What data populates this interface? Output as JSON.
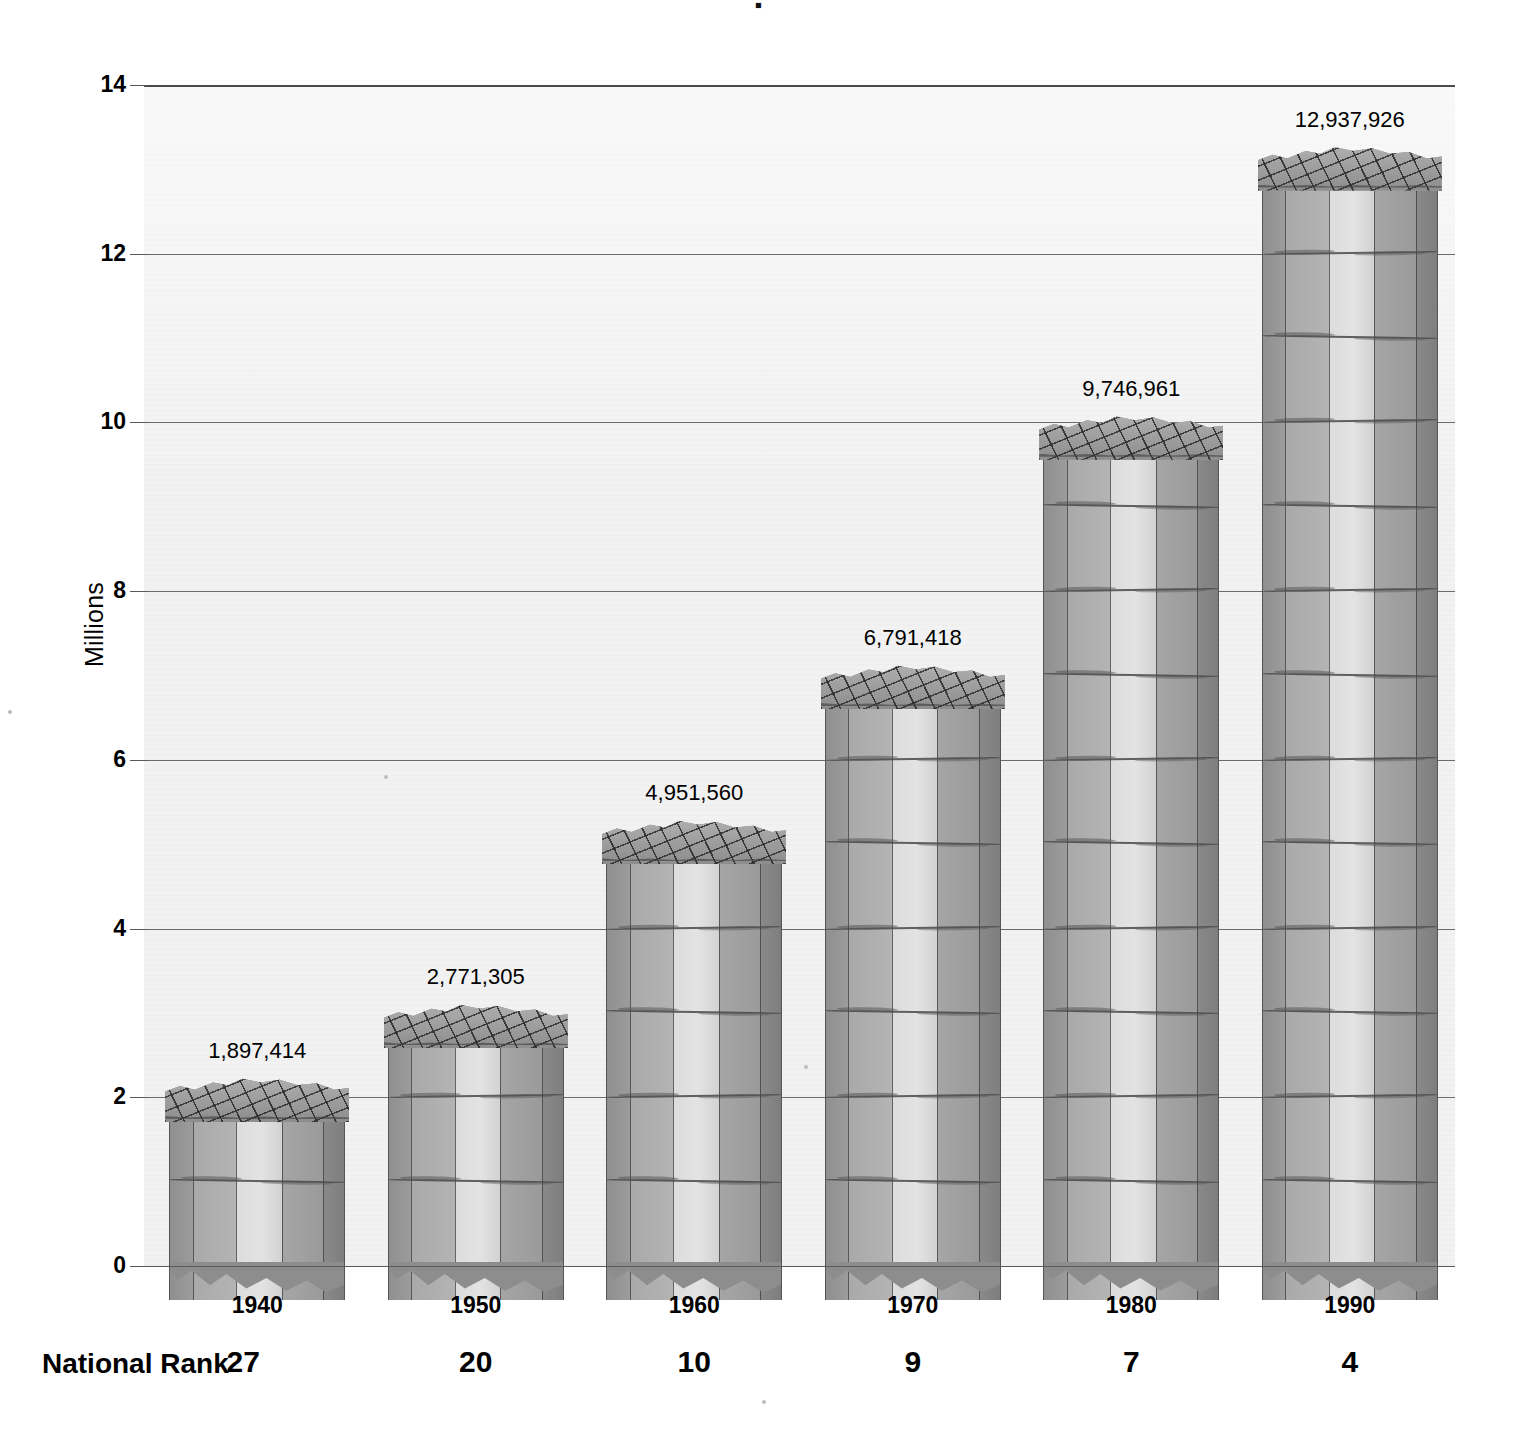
{
  "title_fragment": "▪",
  "axis": {
    "ylabel": "Millions",
    "yticks": [
      "14",
      "12",
      "10",
      "8",
      "6",
      "4",
      "2",
      "0"
    ],
    "ymin": 0,
    "ymax": 14
  },
  "rank_row": {
    "label": "National Rank",
    "values": [
      "27",
      "20",
      "10",
      "9",
      "7",
      "4"
    ]
  },
  "chart_data": {
    "type": "bar",
    "title": "",
    "xlabel": "",
    "ylabel": "Millions",
    "categories": [
      "1940",
      "1950",
      "1960",
      "1970",
      "1980",
      "1990"
    ],
    "values": [
      1897414,
      2771305,
      4951560,
      6791418,
      9746961,
      12937926
    ],
    "value_labels": [
      "1,897,414",
      "2,771,305",
      "4,951,560",
      "6,791,418",
      "9,746,961",
      "12,937,926"
    ],
    "value_scale": "millions",
    "values_in_millions": [
      1.897414,
      2.771305,
      4.95156,
      6.791418,
      9.746961,
      12.937926
    ],
    "ylim": [
      0,
      14
    ],
    "yticks": [
      0,
      2,
      4,
      6,
      8,
      10,
      12,
      14
    ],
    "grid": true,
    "legend": "none",
    "secondary_axis": {
      "label": "National Rank",
      "values": [
        27,
        20,
        10,
        9,
        7,
        4
      ]
    },
    "style": "3d-stone-column bars, greyscale"
  },
  "colors": {
    "plot_background": "#f2f2f2",
    "gridline": "#6b6b6b",
    "column_front": "#dcdcdc",
    "column_side": "#a6a6a6",
    "column_dark": "#8a8a8a",
    "text": "#000000"
  }
}
